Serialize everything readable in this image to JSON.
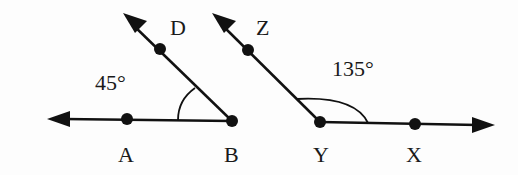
{
  "figure": {
    "left_angle": {
      "points": {
        "A": "A",
        "B": "B",
        "D": "D"
      },
      "measure": "45°",
      "vertex": "B"
    },
    "right_angle": {
      "points": {
        "Y": "Y",
        "X": "X",
        "Z": "Z"
      },
      "measure": "135°",
      "vertex": "Y"
    }
  },
  "colors": {
    "stroke": "#111111",
    "background": "#fdfdfd"
  }
}
